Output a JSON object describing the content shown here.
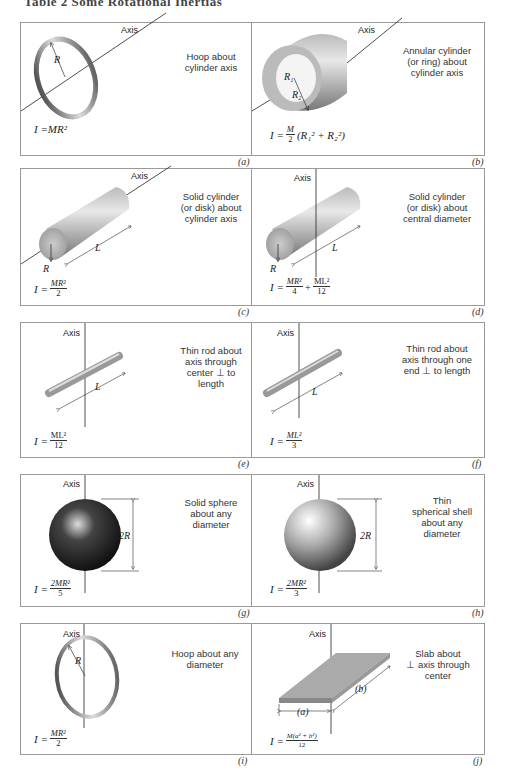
{
  "title": "Table 2  Some Rotational Inertias",
  "axis_label": "Axis",
  "panels": [
    {
      "tag": "(a)",
      "desc": "Hoop about\ncylinder axis",
      "formula_lhs": "I = ",
      "formula": "MR²",
      "symbols": [
        "R"
      ]
    },
    {
      "tag": "(b)",
      "desc": "Annular cylinder\n(or ring) about\ncylinder axis",
      "formula_lhs": "I = ",
      "formula_num": "M",
      "formula_den": "2",
      "formula_rest": "(R₁² + R₂²)",
      "symbols": [
        "R₁",
        "R₂"
      ]
    },
    {
      "tag": "(c)",
      "desc": "Solid cylinder\n(or disk) about\ncylinder axis",
      "formula_lhs": "I = ",
      "formula_num": "MR²",
      "formula_den": "2",
      "symbols": [
        "R",
        "L"
      ]
    },
    {
      "tag": "(d)",
      "desc": "Solid cylinder\n(or disk) about\ncentral diameter",
      "formula_lhs": "I = ",
      "formula_num": "MR²",
      "formula_den": "4",
      "formula_plus": "+",
      "formula_num2": "ML²",
      "formula_den2": "12",
      "symbols": [
        "R",
        "L"
      ]
    },
    {
      "tag": "(e)",
      "desc": "Thin rod about\naxis through\ncenter ⊥ to\nlength",
      "formula_lhs": "I = ",
      "formula_num": "ML²",
      "formula_den": "12",
      "symbols": [
        "L"
      ]
    },
    {
      "tag": "(f)",
      "desc": "Thin rod about\naxis through one\nend ⊥ to length",
      "formula_lhs": "I = ",
      "formula_num": "ML²",
      "formula_den": "3",
      "symbols": [
        "L"
      ]
    },
    {
      "tag": "(g)",
      "desc": "Solid sphere\nabout any\ndiameter",
      "formula_lhs": "I = ",
      "formula_num": "2MR²",
      "formula_den": "5",
      "symbols": [
        "2R"
      ]
    },
    {
      "tag": "(h)",
      "desc": "Thin\nspherical shell\nabout any\ndiameter",
      "formula_lhs": "I = ",
      "formula_num": "2MR²",
      "formula_den": "3",
      "symbols": [
        "2R"
      ]
    },
    {
      "tag": "(i)",
      "desc": "Hoop about any\ndiameter",
      "formula_lhs": "I = ",
      "formula_num": "MR²",
      "formula_den": "2",
      "symbols": [
        "R"
      ]
    },
    {
      "tag": "(j)",
      "desc": "Slab about\n⊥ axis through\ncenter",
      "formula_lhs": "I = ",
      "formula_num": "M(a² + b²)",
      "formula_den": "12",
      "symbols": [
        "(a)",
        "(b)"
      ]
    }
  ]
}
